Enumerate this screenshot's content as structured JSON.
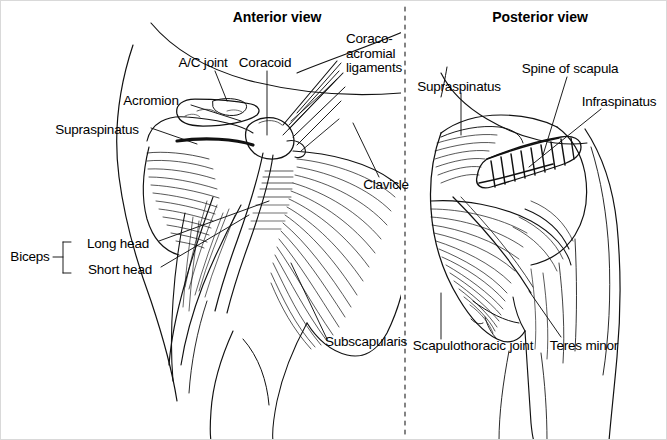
{
  "figure": {
    "width": 667,
    "height": 440,
    "background": "#ffffff",
    "ink": "#000000",
    "border_color": "#d9d9d9",
    "divider": {
      "name": "vertical-dashed-divider",
      "x": 404,
      "style": "dashed"
    }
  },
  "panels": [
    {
      "id": "anterior",
      "title": "Anterior view",
      "title_x": 276,
      "title_y": 16,
      "labels": [
        {
          "id": "ac-joint",
          "text": "A/C joint",
          "x": 202,
          "y": 62,
          "align": "center"
        },
        {
          "id": "coracoid",
          "text": "Coracoid",
          "x": 264,
          "y": 62,
          "align": "center"
        },
        {
          "id": "coraco-acromial",
          "text": "Coraco-\nacromial\nligaments",
          "x": 345,
          "y": 38,
          "align": "left"
        },
        {
          "id": "acromion",
          "text": "Acromion",
          "x": 150,
          "y": 100,
          "align": "center"
        },
        {
          "id": "supraspinatus-ant",
          "text": "Supraspinatus",
          "x": 96,
          "y": 129,
          "align": "center"
        },
        {
          "id": "clavicle",
          "text": "Clavicle",
          "x": 385,
          "y": 184,
          "align": "center"
        },
        {
          "id": "biceps",
          "text": "Biceps",
          "x": 29,
          "y": 256,
          "align": "center"
        },
        {
          "id": "long-head",
          "text": "Long head",
          "x": 117,
          "y": 243,
          "align": "center"
        },
        {
          "id": "short-head",
          "text": "Short head",
          "x": 119,
          "y": 269,
          "align": "center"
        },
        {
          "id": "subscapularis",
          "text": "Subscapularis",
          "x": 365,
          "y": 341,
          "align": "center"
        }
      ]
    },
    {
      "id": "posterior",
      "title": "Posterior view",
      "title_x": 539,
      "title_y": 16,
      "labels": [
        {
          "id": "supraspinatus-post",
          "text": "Supraspinatus",
          "x": 458,
          "y": 86,
          "align": "center"
        },
        {
          "id": "spine-of-scapula",
          "text": "Spine of scapula",
          "x": 569,
          "y": 68,
          "align": "center"
        },
        {
          "id": "infraspinatus",
          "text": "Infraspinatus",
          "x": 618,
          "y": 101,
          "align": "center"
        },
        {
          "id": "scapulothoracic",
          "text": "Scapulothoracic joint",
          "x": 472,
          "y": 345,
          "align": "center"
        },
        {
          "id": "teres-minor",
          "text": "Teres minor",
          "x": 583,
          "y": 345,
          "align": "center"
        }
      ]
    }
  ]
}
